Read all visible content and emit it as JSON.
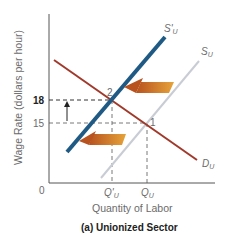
{
  "figure": {
    "caption": "(a) Unionized Sector",
    "y_axis_label": "Wage Rate (dollars per hour)",
    "x_axis_label": "Quantity of Labor",
    "origin_label": "0",
    "y_ticks": [
      {
        "label": "18",
        "bold": true
      },
      {
        "label": "15",
        "bold": false
      }
    ],
    "x_ticks": [
      {
        "label": "Q'",
        "sub": "U"
      },
      {
        "label": "Q",
        "sub": "U"
      }
    ],
    "curves": {
      "demand": {
        "label": "D",
        "sub": "U",
        "color": "#a0392b"
      },
      "new_supply": {
        "label": "S'",
        "sub": "U",
        "color": "#1f5a85"
      },
      "original_supply": {
        "label": "S",
        "sub": "U",
        "color": "#c8ccd4"
      }
    },
    "points": [
      {
        "label": "1"
      },
      {
        "label": "2"
      }
    ],
    "arrow_color_start": "#b8521e",
    "arrow_color_end": "#e6a33a"
  }
}
